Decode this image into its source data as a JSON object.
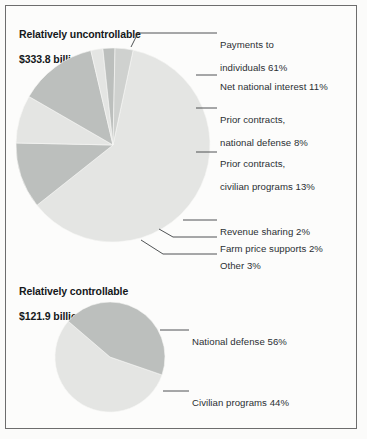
{
  "figure": {
    "background_color": "#fcfcfb",
    "frame_color": "#6d6d6d",
    "label_color": "#2b2f33",
    "title_color": "#15181a"
  },
  "chart_data": [
    {
      "type": "pie",
      "title": "Relatively uncontrollable\n$333.8 billion",
      "title_line1": "Relatively uncontrollable",
      "title_line2": "$333.8 billion",
      "total": "$333.8 billion",
      "categories": [
        "Payments to individuals 61%",
        "Net national interest 11%",
        "Prior contracts, national defense 8%",
        "Prior contracts, civilian programs 13%",
        "Revenue sharing 2%",
        "Farm price supports 2%",
        "Other 3%"
      ],
      "values": [
        61,
        11,
        8,
        13,
        2,
        2,
        3
      ],
      "slice_colors": [
        "#e4e5e3",
        "#bcbfbd",
        "#e4e5e3",
        "#bcbfbd",
        "#e4e5e3",
        "#bcbfbd",
        "#cfd1cf"
      ],
      "labels": [
        {
          "line1": "Payments to",
          "line2": "individuals 61%"
        },
        {
          "line1": "Net national interest 11%",
          "line2": ""
        },
        {
          "line1": "Prior contracts,",
          "line2": "national defense 8%"
        },
        {
          "line1": "Prior contracts,",
          "line2": "civilian programs 13%"
        },
        {
          "line1": "Revenue sharing 2%",
          "line2": ""
        },
        {
          "line1": "Farm price supports 2%",
          "line2": ""
        },
        {
          "line1": "Other 3%",
          "line2": ""
        }
      ],
      "xlabel": "",
      "ylabel": "",
      "legend_position": "right-callouts"
    },
    {
      "type": "pie",
      "title": "Relatively controllable\n$121.9 billion",
      "title_line1": "Relatively controllable",
      "title_line2": "$121.9 billion",
      "total": "$121.9 billion",
      "categories": [
        "National defense 56%",
        "Civilian programs 44%"
      ],
      "values": [
        56,
        44
      ],
      "slice_colors": [
        "#e4e5e3",
        "#bcbfbd"
      ],
      "labels": [
        {
          "line1": "National defense 56%",
          "line2": ""
        },
        {
          "line1": "Civilian programs 44%",
          "line2": ""
        }
      ],
      "xlabel": "",
      "ylabel": "",
      "legend_position": "right-callouts"
    }
  ]
}
